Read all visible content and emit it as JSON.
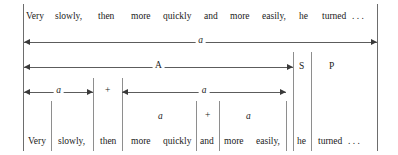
{
  "figure": {
    "sentence_top": "Very   slowly,   then   more   quickly   and   more   easily,   he   turned . . .",
    "top_words": [
      {
        "text": "Very",
        "x": 26,
        "y": 12
      },
      {
        "text": "slowly,",
        "x": 55,
        "y": 12
      },
      {
        "text": "then",
        "x": 98,
        "y": 12
      },
      {
        "text": "more",
        "x": 131,
        "y": 12
      },
      {
        "text": "quickly",
        "x": 163,
        "y": 12
      },
      {
        "text": "and",
        "x": 204,
        "y": 12
      },
      {
        "text": "more",
        "x": 230,
        "y": 12
      },
      {
        "text": "easily,",
        "x": 262,
        "y": 12
      },
      {
        "text": "he",
        "x": 299,
        "y": 12
      },
      {
        "text": "turned",
        "x": 322,
        "y": 12
      },
      {
        "text": ". . .",
        "x": 352,
        "y": 12
      }
    ],
    "bottom_words": [
      {
        "text": "Very",
        "x": 28,
        "y": 137
      },
      {
        "text": "slowly,",
        "x": 58,
        "y": 137
      },
      {
        "text": "then",
        "x": 100,
        "y": 137
      },
      {
        "text": "more",
        "x": 131,
        "y": 137
      },
      {
        "text": "quickly",
        "x": 163,
        "y": 137
      },
      {
        "text": "and",
        "x": 200,
        "y": 137
      },
      {
        "text": "more",
        "x": 224,
        "y": 137
      },
      {
        "text": "easily,",
        "x": 256,
        "y": 137
      },
      {
        "text": "he",
        "x": 297,
        "y": 137
      },
      {
        "text": "turned",
        "x": 318,
        "y": 137
      },
      {
        "text": ". . .",
        "x": 348,
        "y": 137
      }
    ],
    "arrows": [
      {
        "id": "a-full",
        "label": "a",
        "x": 24,
        "width": 353,
        "y": 38,
        "heads": "both",
        "italic": true
      },
      {
        "id": "A-span",
        "label": "A",
        "x": 24,
        "width": 269,
        "y": 63,
        "heads": "both",
        "italic": false
      },
      {
        "id": "a-left",
        "label": "a",
        "x": 24,
        "width": 69,
        "y": 88,
        "heads": "both",
        "italic": true
      },
      {
        "id": "a-right",
        "label": "a",
        "x": 122,
        "width": 164,
        "y": 88,
        "heads": "both",
        "italic": true
      }
    ],
    "constituent_labels": [
      {
        "text": "S",
        "x": 299,
        "y": 62,
        "italic": false
      },
      {
        "text": "P",
        "x": 329,
        "y": 62,
        "italic": false
      },
      {
        "text": "+",
        "x": 105,
        "y": 86,
        "italic": false
      },
      {
        "text": "a",
        "x": 158,
        "y": 112,
        "italic": true
      },
      {
        "text": "+",
        "x": 205,
        "y": 111,
        "italic": false
      },
      {
        "text": "a",
        "x": 246,
        "y": 112,
        "italic": true
      }
    ],
    "rules": [
      {
        "id": "border-left",
        "x": 23,
        "y": 4,
        "height": 147
      },
      {
        "id": "border-right",
        "x": 377,
        "y": 4,
        "height": 147
      },
      {
        "id": "div-s-start",
        "x": 293,
        "y": 52,
        "height": 99
      },
      {
        "id": "div-s-end",
        "x": 311,
        "y": 52,
        "height": 99
      },
      {
        "id": "div-very",
        "x": 51,
        "y": 101,
        "height": 50
      },
      {
        "id": "div-slowly",
        "x": 93,
        "y": 78,
        "height": 73
      },
      {
        "id": "div-then",
        "x": 122,
        "y": 78,
        "height": 73
      },
      {
        "id": "div-quickly",
        "x": 196,
        "y": 101,
        "height": 50
      },
      {
        "id": "div-and",
        "x": 219,
        "y": 101,
        "height": 50
      },
      {
        "id": "div-easily",
        "x": 286,
        "y": 101,
        "height": 50
      }
    ]
  },
  "colors": {
    "ink": "#1a1a1a",
    "rule": "#6d6d6d",
    "arrow": "#5c5c5c",
    "page": "#ffffff"
  }
}
